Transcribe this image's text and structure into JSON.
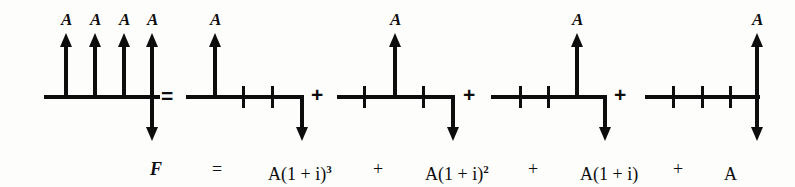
{
  "figure": {
    "type": "cash-flow-diagram",
    "ink_color": "#0d0d0d",
    "background_color": "#fdfdfc"
  },
  "labels": {
    "A": "A",
    "F": "F",
    "equals": "=",
    "plus": "+"
  },
  "diagrams": [
    {
      "id": "uniform-series",
      "name": "uniform-series-cash-flow",
      "periods": 4,
      "baseline_x": [
        44,
        160
      ],
      "arrows_up": [
        {
          "x": 66,
          "label": "A"
        },
        {
          "x": 95,
          "label": "A"
        },
        {
          "x": 124,
          "label": "A"
        },
        {
          "x": 152,
          "label": "A"
        }
      ],
      "arrows_down": [
        {
          "x": 152,
          "label": ""
        }
      ],
      "ticks": []
    },
    {
      "id": "term-1",
      "name": "single-payment-period-0",
      "periods": 3,
      "baseline_x": [
        186,
        303
      ],
      "arrows_up": [
        {
          "x": 215,
          "label": "A"
        }
      ],
      "arrows_down": [
        {
          "x": 302,
          "label": ""
        }
      ],
      "ticks": [
        243,
        272
      ]
    },
    {
      "id": "term-2",
      "name": "single-payment-period-1",
      "periods": 3,
      "baseline_x": [
        337,
        454
      ],
      "arrows_up": [
        {
          "x": 395,
          "label": "A"
        }
      ],
      "arrows_down": [
        {
          "x": 452,
          "label": ""
        }
      ],
      "ticks": [
        364,
        423
      ]
    },
    {
      "id": "term-3",
      "name": "single-payment-period-2",
      "periods": 3,
      "baseline_x": [
        491,
        606
      ],
      "arrows_up": [
        {
          "x": 577,
          "label": "A"
        }
      ],
      "arrows_down": [
        {
          "x": 604,
          "label": ""
        }
      ],
      "ticks": [
        520,
        548
      ]
    },
    {
      "id": "term-4",
      "name": "single-payment-period-3",
      "periods": 3,
      "baseline_x": [
        645,
        760
      ],
      "arrows_up": [
        {
          "x": 758,
          "label": "A"
        }
      ],
      "arrows_down": [
        {
          "x": 758,
          "label": "A"
        }
      ],
      "ticks": [
        673,
        702,
        730
      ]
    }
  ],
  "operators": [
    {
      "symbol": "=",
      "x": 160,
      "name": "equals-sign"
    },
    {
      "symbol": "+",
      "x": 310,
      "name": "plus-sign-1"
    },
    {
      "symbol": "+",
      "x": 462,
      "name": "plus-sign-2"
    },
    {
      "symbol": "+",
      "x": 613,
      "name": "plus-sign-3"
    }
  ],
  "equation": {
    "lhs": "F",
    "equals": "=",
    "terms": [
      {
        "base": "A(1 + i)",
        "exponent": "3"
      },
      {
        "base": "A(1 + i)",
        "exponent": "2"
      },
      {
        "base": "A(1 + i)",
        "exponent": ""
      },
      {
        "base": "A",
        "exponent": ""
      }
    ],
    "operators": [
      "+",
      "+",
      "+"
    ],
    "full_text": "F = A(1 + i)3 + A(1 + i)2 + A(1 + i) + A"
  },
  "equation_layout": {
    "lhs_x": 150,
    "equals_x": 212,
    "term_x": [
      268,
      425,
      580,
      724
    ],
    "op_x": [
      373,
      528,
      673
    ]
  }
}
